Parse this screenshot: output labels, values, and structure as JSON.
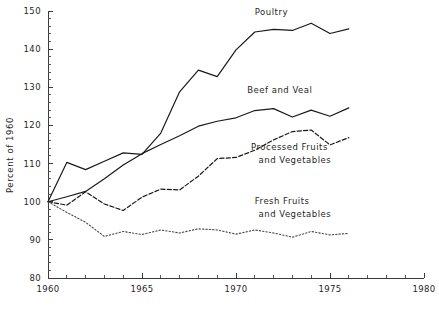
{
  "chart_data": {
    "type": "line",
    "title": "",
    "xlabel": "",
    "ylabel": "Percent of 1960",
    "xlim": [
      1960,
      1980
    ],
    "ylim": [
      80,
      150
    ],
    "x_ticks_major": [
      1960,
      1965,
      1970,
      1975,
      1980
    ],
    "x_ticks_minor_step": 1,
    "y_ticks_major": [
      80,
      90,
      100,
      110,
      120,
      130,
      140,
      150
    ],
    "y_ticks_minor_step": 2,
    "grid": false,
    "legend_position": "inline-annotations",
    "x": [
      1960,
      1961,
      1962,
      1963,
      1964,
      1965,
      1966,
      1967,
      1968,
      1969,
      1970,
      1971,
      1972,
      1973,
      1974,
      1975,
      1976
    ],
    "series": [
      {
        "name": "Poultry",
        "style": "solid",
        "label": "Poultry",
        "values": [
          100.0,
          110.3,
          108.4,
          110.6,
          112.8,
          112.4,
          118.0,
          128.8,
          134.5,
          132.8,
          139.8,
          144.5,
          145.2,
          144.9,
          146.8,
          144.1,
          145.3
        ]
      },
      {
        "name": "Beef and Veal",
        "style": "solid",
        "label": "Beef and Veal",
        "values": [
          100.0,
          101.3,
          102.7,
          106.0,
          109.6,
          112.6,
          115.0,
          117.3,
          119.8,
          121.1,
          122.0,
          123.9,
          124.4,
          122.2,
          124.0,
          122.4,
          124.6
        ]
      },
      {
        "name": "Processed Fruits and Vegetables",
        "style": "dashed",
        "label": "Processed Fruits and Vegetables",
        "values": [
          100.0,
          99.1,
          102.6,
          99.4,
          97.7,
          101.2,
          103.3,
          103.1,
          106.7,
          111.3,
          111.6,
          113.5,
          116.2,
          118.4,
          118.8,
          114.9,
          116.8
        ]
      },
      {
        "name": "Fresh Fruits and Vegetables",
        "style": "dotted",
        "label": "Fresh Fruits and Vegetables",
        "values": [
          100.0,
          97.2,
          94.6,
          90.9,
          92.2,
          91.4,
          92.6,
          91.8,
          92.9,
          92.6,
          91.5,
          92.6,
          91.8,
          90.7,
          92.2,
          91.3,
          91.7
        ]
      }
    ],
    "annotations": [
      {
        "name": "poultry-label",
        "text": "Poultry",
        "x": 1971.0,
        "y": 149.0
      },
      {
        "name": "beef-and-veal-label",
        "text": "Beef and Veal",
        "x": 1970.6,
        "y": 128.6
      },
      {
        "name": "processed-fruits-label-line1",
        "text": "Processed Fruits",
        "x": 1970.8,
        "y": 113.6
      },
      {
        "name": "processed-fruits-label-line2",
        "text": "and  Vegetables",
        "x": 1971.2,
        "y": 110.2
      },
      {
        "name": "fresh-fruits-label-line1",
        "text": "Fresh Fruits",
        "x": 1971.0,
        "y": 99.3
      },
      {
        "name": "fresh-fruits-label-line2",
        "text": "and  Vegetables",
        "x": 1971.2,
        "y": 95.9
      }
    ],
    "y_tick_labels": [
      "150",
      "140",
      "130",
      "120",
      "110",
      "100",
      "90",
      "80"
    ],
    "x_tick_labels": [
      "1960",
      "1965",
      "1970",
      "1975",
      "1980"
    ]
  }
}
